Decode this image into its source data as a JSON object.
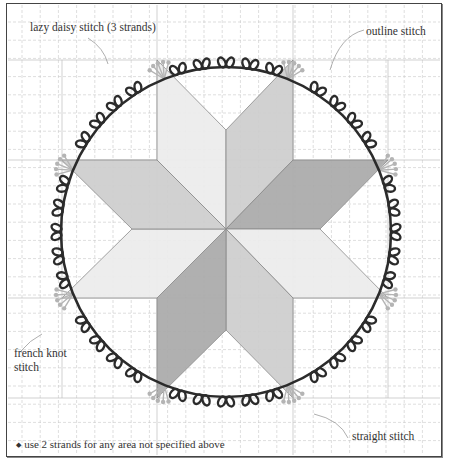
{
  "diagram": {
    "type": "embroidery-pattern",
    "labels": {
      "lazy_daisy": "lazy daisy stitch  (3 strands)",
      "outline": "outline stitch",
      "french_knot_line1": "french knot",
      "french_knot_line2": "stitch",
      "straight": "straight stitch",
      "note": "use 2 strands for any area not specified above",
      "note_bullet": "◆"
    },
    "colors": {
      "grid": "#c8c8c8",
      "frame": "#444444",
      "vine": "#2b2b2b",
      "flower": "#b4b4b4",
      "star_light": "#ececec",
      "star_mid": "#cdcdcd",
      "star_dark": "#a9a9a9",
      "star_edge": "#8a8a8a",
      "leader": "#9a9a9a"
    },
    "star": {
      "center": [
        226,
        229
      ],
      "points": 8
    },
    "wreath": {
      "center": [
        226,
        232
      ],
      "radius": 165,
      "leaf_pairs": 44,
      "flower_sprays": 8
    }
  }
}
